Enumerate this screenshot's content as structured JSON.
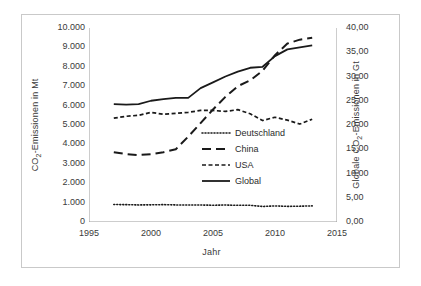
{
  "chart_data": {
    "type": "line",
    "title": "",
    "xlabel": "Jahr",
    "ylabel": "CO2-Emissionen in Mt",
    "ylabel_right": "Globale CO2-Emissionen in Gt",
    "xlim": [
      1995,
      2015
    ],
    "ylim": [
      0,
      10000
    ],
    "ylim_right": [
      0,
      40
    ],
    "grid": false,
    "legend_position": "center-right-inside",
    "xticks": [
      "1995",
      "2000",
      "2005",
      "2010",
      "2015"
    ],
    "xtick_values": [
      1995,
      2000,
      2005,
      2010,
      2015
    ],
    "yticks_left": [
      "0",
      "1.000",
      "2.000",
      "3.000",
      "4.000",
      "5.000",
      "6.000",
      "7.000",
      "8.000",
      "9.000",
      "10.000"
    ],
    "ytick_values_left": [
      0,
      1000,
      2000,
      3000,
      4000,
      5000,
      6000,
      7000,
      8000,
      9000,
      10000
    ],
    "yticks_right": [
      "0,00",
      "5,00",
      "10,00",
      "15,00",
      "20,00",
      "25,00",
      "30,00",
      "35,00",
      "40,00"
    ],
    "ytick_values_right": [
      0,
      5,
      10,
      15,
      20,
      25,
      30,
      35,
      40
    ],
    "x": [
      1997,
      1998,
      1999,
      2000,
      2001,
      2002,
      2003,
      2004,
      2005,
      2006,
      2007,
      2008,
      2009,
      2010,
      2011,
      2012,
      2013
    ],
    "series": [
      {
        "name": "Deutschland",
        "style": "dotted",
        "axis": "left",
        "values": [
          900,
          895,
          880,
          885,
          895,
          880,
          880,
          875,
          865,
          875,
          860,
          860,
          800,
          830,
          805,
          815,
          830
        ]
      },
      {
        "name": "China",
        "style": "long-dash",
        "axis": "left",
        "values": [
          3600,
          3500,
          3450,
          3500,
          3600,
          3750,
          4400,
          5100,
          5800,
          6450,
          7000,
          7300,
          7800,
          8600,
          9200,
          9400,
          9500
        ]
      },
      {
        "name": "USA",
        "style": "short-dash",
        "axis": "left",
        "values": [
          5350,
          5450,
          5500,
          5650,
          5550,
          5600,
          5650,
          5750,
          5750,
          5700,
          5790,
          5580,
          5230,
          5400,
          5250,
          5050,
          5300
        ]
      },
      {
        "name": "Global",
        "style": "solid",
        "axis": "right",
        "values": [
          6080,
          6050,
          6080,
          6250,
          6330,
          6400,
          6400,
          6900,
          7200,
          7500,
          7750,
          7950,
          8000,
          8550,
          8900,
          9000,
          9100
        ]
      }
    ]
  }
}
